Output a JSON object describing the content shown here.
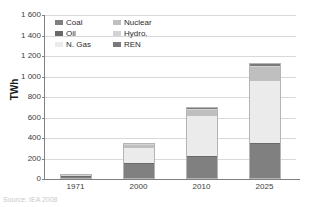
{
  "chart_data": {
    "type": "bar",
    "stacked": true,
    "title": "",
    "xlabel": "",
    "ylabel": "TWh",
    "ylim": [
      0,
      1600
    ],
    "ytick_step": 200,
    "ytick_labels": [
      "0",
      "200",
      "400",
      "600",
      "800",
      "1 000",
      "1 200",
      "1 400",
      "1 600"
    ],
    "grid": true,
    "legend_position": "top-left-inside",
    "categories": [
      "1971",
      "2000",
      "2010",
      "2025"
    ],
    "series": [
      {
        "name": "Coal",
        "color": "#808080",
        "values": [
          12,
          140,
          205,
          330
        ]
      },
      {
        "name": "Oil",
        "color": "#696969",
        "values": [
          6,
          10,
          10,
          10
        ]
      },
      {
        "name": "N. Gas",
        "color": "#ebebeb",
        "values": [
          4,
          140,
          390,
          610
        ]
      },
      {
        "name": "Nuclear",
        "color": "#bfbfbf",
        "values": [
          0,
          35,
          55,
          130
        ]
      },
      {
        "name": "Hydro.",
        "color": "#d4d4d4",
        "values": [
          3,
          8,
          12,
          18
        ]
      },
      {
        "name": "REN",
        "color": "#7a7a7a",
        "values": [
          0,
          2,
          8,
          17
        ]
      }
    ],
    "totals": [
      25,
      335,
      680,
      1115
    ],
    "legend_entries": [
      {
        "label": "Coal",
        "color": "#808080"
      },
      {
        "label": "Nuclear",
        "color": "#bfbfbf"
      },
      {
        "label": "Oil",
        "color": "#696969"
      },
      {
        "label": "Hydro.",
        "color": "#d4d4d4"
      },
      {
        "label": "N. Gas",
        "color": "#ebebeb"
      },
      {
        "label": "REN",
        "color": "#7a7a7a"
      }
    ]
  },
  "caption": {
    "text": "Source: IEA 2008"
  },
  "colors": {
    "axis": "#808080",
    "grid": "#d9d9d9",
    "text": "#3c3c3c",
    "bar_border": "#b4b4b4"
  }
}
